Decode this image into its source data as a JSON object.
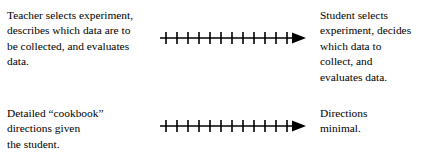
{
  "figure": {
    "background_color": "#ffffff",
    "line_color": "#000000"
  },
  "rows": [
    {
      "id": "row-top",
      "left_label": "Teacher selects experiment,\ndescribes which data are to\nbe collected, and evaluates\ndata.",
      "right_label": "Student selects\nexperiment, decides\nwhich data to\ncollect, and\nevaluates data.",
      "arrow": {
        "name": "continuum-arrow-top",
        "direction": "right",
        "tick_count": 12,
        "has_arrowhead": true
      }
    },
    {
      "id": "row-bottom",
      "left_label": "Detailed “cookbook”\ndirections given\nthe student.",
      "right_label": "Directions\nminimal.",
      "arrow": {
        "name": "continuum-arrow-bottom",
        "direction": "right",
        "tick_count": 12,
        "has_arrowhead": true
      }
    }
  ]
}
